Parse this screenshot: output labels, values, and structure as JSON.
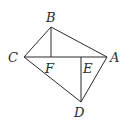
{
  "diagram": {
    "type": "geometry",
    "points": [
      {
        "id": "A",
        "x": 107,
        "y": 57,
        "label": "A",
        "lx": 110,
        "ly": 62
      },
      {
        "id": "B",
        "x": 51,
        "y": 27,
        "label": "B",
        "lx": 46,
        "ly": 22
      },
      {
        "id": "C",
        "x": 24,
        "y": 57,
        "label": "C",
        "lx": 8,
        "ly": 62
      },
      {
        "id": "D",
        "x": 81,
        "y": 102,
        "label": "D",
        "lx": 74,
        "ly": 117
      },
      {
        "id": "E",
        "x": 81,
        "y": 57,
        "label": "E",
        "lx": 83,
        "ly": 73
      },
      {
        "id": "F",
        "x": 51,
        "y": 57,
        "label": "F",
        "lx": 45,
        "ly": 73
      }
    ],
    "segments": [
      [
        "C",
        "B"
      ],
      [
        "B",
        "A"
      ],
      [
        "C",
        "A"
      ],
      [
        "C",
        "D"
      ],
      [
        "D",
        "A"
      ],
      [
        "B",
        "F"
      ],
      [
        "E",
        "D"
      ]
    ]
  }
}
